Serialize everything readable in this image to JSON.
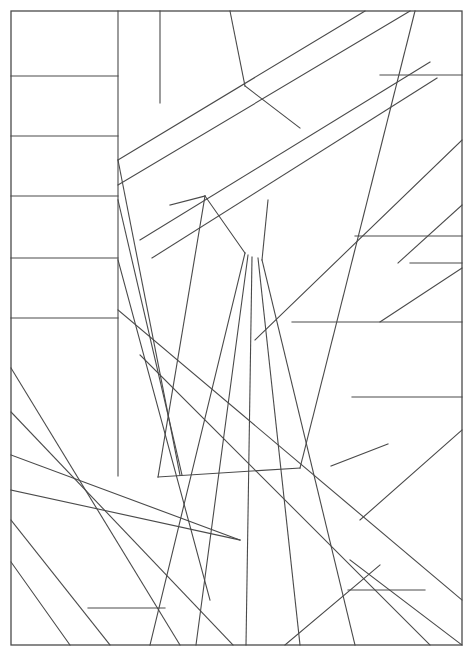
{
  "document": {
    "kind": "line-art-illustration",
    "title": "Abstract Geometric Line Composition",
    "style": "coloring-page outline drawing",
    "canvas_width": 475,
    "canvas_height": 659,
    "background_color": "#ffffff",
    "stroke_color": "#4a4a4a",
    "stroke_width": 1.1
  },
  "frame": {
    "name": "outer-border-rectangle",
    "x": 11,
    "y": 11,
    "width": 451,
    "height": 634,
    "stroke_color": "#4a4a4a"
  },
  "geometry": {
    "description": "Rectangular frame subdivided by straight segments into irregular polygonal panels.",
    "segments": [
      {
        "id": "left-col-divider-vertical",
        "x1": 118,
        "y1": 11,
        "x2": 118,
        "y2": 476
      },
      {
        "id": "left-col-rule-1",
        "x1": 11,
        "y1": 76,
        "x2": 118,
        "y2": 76
      },
      {
        "id": "left-col-rule-2",
        "x1": 11,
        "y1": 136,
        "x2": 118,
        "y2": 136
      },
      {
        "id": "left-col-rule-3",
        "x1": 11,
        "y1": 196,
        "x2": 118,
        "y2": 196
      },
      {
        "id": "left-col-rule-4",
        "x1": 11,
        "y1": 258,
        "x2": 118,
        "y2": 258
      },
      {
        "id": "left-col-rule-5",
        "x1": 11,
        "y1": 318,
        "x2": 118,
        "y2": 318
      },
      {
        "id": "lower-left-diagonal-1",
        "x1": 11,
        "y1": 368,
        "x2": 180,
        "y2": 645
      },
      {
        "id": "lower-left-diagonal-2",
        "x1": 11,
        "y1": 412,
        "x2": 233,
        "y2": 645
      },
      {
        "id": "lower-left-diagonal-3",
        "x1": 11,
        "y1": 455,
        "x2": 240,
        "y2": 540
      },
      {
        "id": "lower-left-diagonal-4",
        "x1": 11,
        "y1": 490,
        "x2": 240,
        "y2": 540
      },
      {
        "id": "lower-left-diagonal-5",
        "x1": 11,
        "y1": 520,
        "x2": 110,
        "y2": 645
      },
      {
        "id": "lower-left-diagonal-6",
        "x1": 11,
        "y1": 562,
        "x2": 70,
        "y2": 645
      },
      {
        "id": "lower-left-horizontal-stub",
        "x1": 88,
        "y1": 608,
        "x2": 165,
        "y2": 608
      },
      {
        "id": "top-vertical-short-a",
        "x1": 160,
        "y1": 11,
        "x2": 160,
        "y2": 103
      },
      {
        "id": "top-vertical-short-b",
        "x1": 230,
        "y1": 11,
        "x2": 245,
        "y2": 86
      },
      {
        "id": "top-band-upper-edge",
        "x1": 118,
        "y1": 185,
        "x2": 410,
        "y2": 11
      },
      {
        "id": "top-band-mid-edge",
        "x1": 118,
        "y1": 160,
        "x2": 365,
        "y2": 11
      },
      {
        "id": "top-band-lower-edge",
        "x1": 140,
        "y1": 240,
        "x2": 430,
        "y2": 62
      },
      {
        "id": "top-band-lower-edge-2",
        "x1": 152,
        "y1": 258,
        "x2": 437,
        "y2": 78
      },
      {
        "id": "top-diagonal-connector",
        "x1": 245,
        "y1": 86,
        "x2": 300,
        "y2": 128
      },
      {
        "id": "steep-long-right",
        "x1": 415,
        "y1": 11,
        "x2": 300,
        "y2": 468
      },
      {
        "id": "right-horizontal-top",
        "x1": 380,
        "y1": 75,
        "x2": 462,
        "y2": 75
      },
      {
        "id": "right-long-diagonal",
        "x1": 462,
        "y1": 140,
        "x2": 255,
        "y2": 340
      },
      {
        "id": "right-horizontal-mid-1",
        "x1": 355,
        "y1": 236,
        "x2": 462,
        "y2": 236
      },
      {
        "id": "right-horizontal-mid-2",
        "x1": 410,
        "y1": 263,
        "x2": 462,
        "y2": 263
      },
      {
        "id": "right-diagonal-small-1",
        "x1": 462,
        "y1": 205,
        "x2": 398,
        "y2": 263
      },
      {
        "id": "right-diagonal-small-2",
        "x1": 462,
        "y1": 268,
        "x2": 380,
        "y2": 322
      },
      {
        "id": "right-horizontal-long",
        "x1": 292,
        "y1": 322,
        "x2": 462,
        "y2": 322
      },
      {
        "id": "right-horizontal-lower",
        "x1": 352,
        "y1": 397,
        "x2": 462,
        "y2": 397
      },
      {
        "id": "right-short-chord",
        "x1": 331,
        "y1": 466,
        "x2": 388,
        "y2": 444
      },
      {
        "id": "fan-line-1",
        "x1": 245,
        "y1": 253,
        "x2": 150,
        "y2": 645
      },
      {
        "id": "fan-line-2",
        "x1": 248,
        "y1": 255,
        "x2": 196,
        "y2": 645
      },
      {
        "id": "fan-line-3",
        "x1": 252,
        "y1": 257,
        "x2": 246,
        "y2": 645
      },
      {
        "id": "fan-line-4",
        "x1": 258,
        "y1": 258,
        "x2": 300,
        "y2": 645
      },
      {
        "id": "fan-line-5",
        "x1": 262,
        "y1": 260,
        "x2": 355,
        "y2": 645
      },
      {
        "id": "fan-upper-apex-left",
        "x1": 205,
        "y1": 196,
        "x2": 245,
        "y2": 253
      },
      {
        "id": "fan-upper-apex-right",
        "x1": 268,
        "y1": 200,
        "x2": 262,
        "y2": 260
      },
      {
        "id": "panel-left-diagonal-a",
        "x1": 118,
        "y1": 160,
        "x2": 180,
        "y2": 475
      },
      {
        "id": "panel-left-diagonal-b",
        "x1": 118,
        "y1": 200,
        "x2": 182,
        "y2": 475
      },
      {
        "id": "panel-left-diagonal-c",
        "x1": 118,
        "y1": 260,
        "x2": 210,
        "y2": 600
      },
      {
        "id": "panel-inner-rect-top",
        "x1": 170,
        "y1": 205,
        "x2": 205,
        "y2": 196
      },
      {
        "id": "panel-inner-rect-bottom",
        "x1": 158,
        "y1": 477,
        "x2": 205,
        "y2": 196
      },
      {
        "id": "panel-inner-rect-base",
        "x1": 158,
        "y1": 477,
        "x2": 300,
        "y2": 468
      },
      {
        "id": "big-diagonal-center",
        "x1": 118,
        "y1": 310,
        "x2": 462,
        "y2": 600
      },
      {
        "id": "big-diagonal-center-2",
        "x1": 140,
        "y1": 355,
        "x2": 430,
        "y2": 645
      },
      {
        "id": "br-cross-a",
        "x1": 360,
        "y1": 520,
        "x2": 462,
        "y2": 430
      },
      {
        "id": "br-cross-b",
        "x1": 350,
        "y1": 560,
        "x2": 462,
        "y2": 645
      },
      {
        "id": "br-horizontal",
        "x1": 348,
        "y1": 590,
        "x2": 425,
        "y2": 590
      },
      {
        "id": "br-diagonal-edge",
        "x1": 285,
        "y1": 645,
        "x2": 380,
        "y2": 565
      }
    ]
  },
  "regions": {
    "count_estimate": 48,
    "fill_color": "#ffffff",
    "note": "All enclosed panels are unfilled white outlines."
  }
}
